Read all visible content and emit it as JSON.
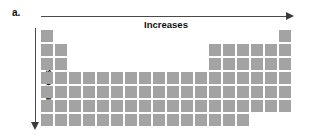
{
  "figure": {
    "panel_label": "a.",
    "horizontal_axis": {
      "label": "Increases",
      "direction": "right",
      "arrow_icon": "arrow-right-icon"
    },
    "vertical_axis": {
      "label": "Increases",
      "direction": "down",
      "arrow_icon": "arrow-down-icon"
    }
  },
  "colors": {
    "cell_fill": "#a3a3a3",
    "axis_line": "#4a4a4a",
    "text": "#111111",
    "background": "#ffffff"
  },
  "chart_data": {
    "type": "heatmap",
    "title": "",
    "subtitle": "",
    "xlabel": "Increases",
    "ylabel": "Increases",
    "grid": false,
    "legend_position": "none",
    "columns": 18,
    "rows": 7,
    "cell_size_px": 12,
    "cell_gap_px": 2,
    "annotations": [
      "a."
    ],
    "row_filled_columns": [
      [
        1,
        18
      ],
      [
        1,
        2,
        13,
        14,
        15,
        16,
        17,
        18
      ],
      [
        1,
        2,
        13,
        14,
        15,
        16,
        17,
        18
      ],
      [
        1,
        2,
        3,
        4,
        5,
        6,
        7,
        8,
        9,
        10,
        11,
        12,
        13,
        14,
        15,
        16,
        17,
        18
      ],
      [
        1,
        2,
        3,
        4,
        5,
        6,
        7,
        8,
        9,
        10,
        11,
        12,
        13,
        14,
        15,
        16,
        17,
        18
      ],
      [
        1,
        2,
        3,
        4,
        5,
        6,
        7,
        8,
        9,
        10,
        11,
        12,
        13,
        14,
        15,
        16,
        17,
        18
      ],
      [
        1,
        2,
        3,
        4,
        5,
        6,
        7,
        8,
        9,
        10,
        11,
        12,
        13,
        14,
        15
      ]
    ],
    "values": [
      [
        1,
        0,
        0,
        0,
        0,
        0,
        0,
        0,
        0,
        0,
        0,
        0,
        0,
        0,
        0,
        0,
        0,
        1
      ],
      [
        1,
        1,
        0,
        0,
        0,
        0,
        0,
        0,
        0,
        0,
        0,
        0,
        1,
        1,
        1,
        1,
        1,
        1
      ],
      [
        1,
        1,
        0,
        0,
        0,
        0,
        0,
        0,
        0,
        0,
        0,
        0,
        1,
        1,
        1,
        1,
        1,
        1
      ],
      [
        1,
        1,
        1,
        1,
        1,
        1,
        1,
        1,
        1,
        1,
        1,
        1,
        1,
        1,
        1,
        1,
        1,
        1
      ],
      [
        1,
        1,
        1,
        1,
        1,
        1,
        1,
        1,
        1,
        1,
        1,
        1,
        1,
        1,
        1,
        1,
        1,
        1
      ],
      [
        1,
        1,
        1,
        1,
        1,
        1,
        1,
        1,
        1,
        1,
        1,
        1,
        1,
        1,
        1,
        1,
        1,
        1
      ],
      [
        1,
        1,
        1,
        1,
        1,
        1,
        1,
        1,
        1,
        1,
        1,
        1,
        1,
        1,
        1,
        0,
        0,
        0
      ]
    ]
  }
}
